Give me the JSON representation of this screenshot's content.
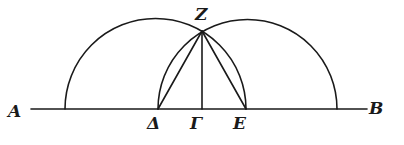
{
  "diagram": {
    "type": "geometric-construction",
    "points": [
      {
        "id": "A",
        "label": "A",
        "x": 18,
        "y": 117
      },
      {
        "id": "B",
        "label": "B",
        "x": 373,
        "y": 114
      },
      {
        "id": "Z",
        "label": "Z",
        "x": 195,
        "y": 18
      },
      {
        "id": "Delta",
        "label": "Δ",
        "x": 152,
        "y": 131
      },
      {
        "id": "Gamma",
        "label": "Γ",
        "x": 195,
        "y": 131
      },
      {
        "id": "E",
        "label": "E",
        "x": 239,
        "y": 131
      }
    ],
    "segments": [
      "AB",
      "ZΓ",
      "ZΔ",
      "ZE"
    ],
    "arcs": [
      {
        "name": "left semicircle",
        "from": "foot left of Δ",
        "to": "E",
        "through": "Z"
      },
      {
        "name": "right semicircle",
        "from": "Δ",
        "to": "foot right of E",
        "through": "Z"
      }
    ]
  }
}
